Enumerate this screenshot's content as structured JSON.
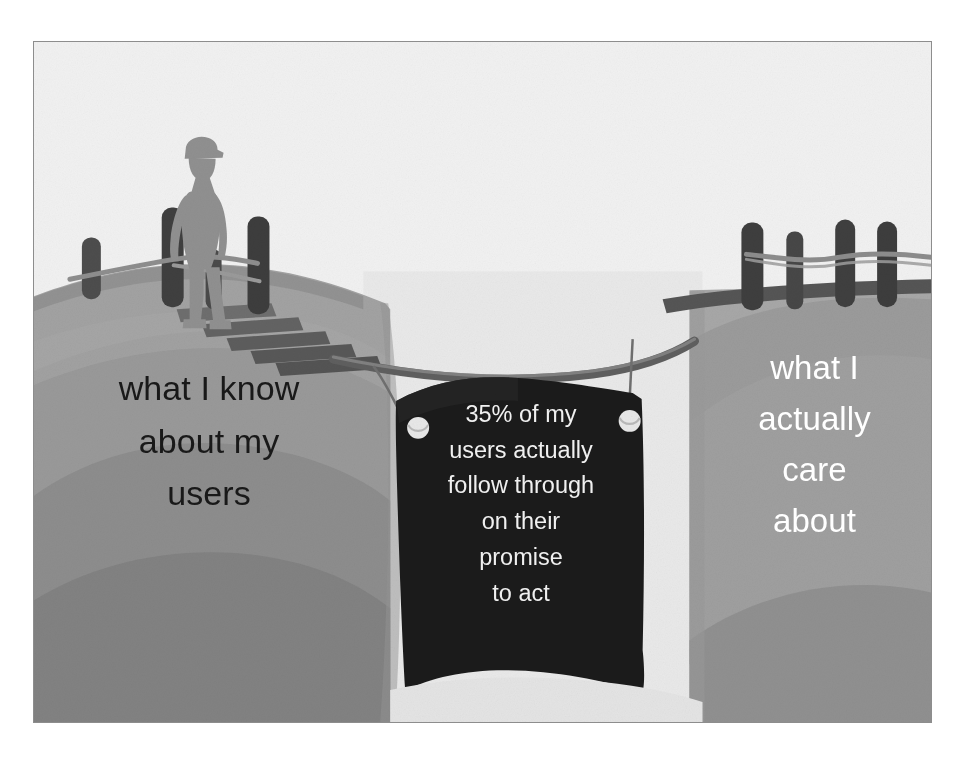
{
  "illustration": {
    "alt_name": "chasm-bridge-metaphor-illustration",
    "left_cliff_caption": "what I know\nabout my\nusers",
    "right_cliff_caption": "what I\nactually\ncare\nabout",
    "banner_text": "35% of my\nusers actually\nfollow through\non their\npromise\nto act",
    "banner_statistic": "35%",
    "figure_label": "person-silhouette",
    "bridge_label": "rope-plank-bridge",
    "colors": {
      "sky": "#f1f1f1",
      "frame_border": "#8d8d8d",
      "left_cliff_light": "#a3a3a3",
      "left_cliff_mid": "#9a9a9a",
      "left_cliff_dark": "#8a8a8a",
      "left_cliff_darker": "#7d7d7d",
      "right_cliff_light": "#a8a8a8",
      "right_cliff_mid": "#9c9c9c",
      "right_cliff_dark": "#8e8e8e",
      "chasm_background": "#e6e6e6",
      "banner_fabric": "#1a1a1a",
      "banner_text_color": "#f0f0f0",
      "post_dark": "#4a4a4a",
      "plank_dark": "#5a5a5a",
      "rope": "#8f8f8f",
      "figure_silhouette": "#8f8f8f",
      "left_caption_color": "#191919",
      "right_caption_color": "#ffffff",
      "grommet": "#e9e9e9"
    }
  }
}
